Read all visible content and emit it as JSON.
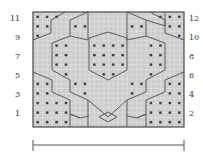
{
  "chart": {
    "columns": 16,
    "rows": 12,
    "colors": {
      "background": "#cdcdcd",
      "grid": "#e6e6e6",
      "border": "#4a4a4a",
      "cable_line": "#5a5a5a",
      "dot": "#3e3e3e",
      "label": "#333333",
      "scale_bar": "#555555"
    },
    "left_row_labels": [
      "11",
      "9",
      "7",
      "5",
      "3",
      "1"
    ],
    "right_row_labels": [
      "12",
      "10",
      "8",
      "6",
      "4",
      "2"
    ],
    "dots": [
      [
        0,
        [
          0,
          1,
          2,
          13,
          14,
          15
        ]
      ],
      [
        1,
        [
          0,
          1,
          4,
          5,
          10,
          11,
          14,
          15
        ]
      ],
      [
        2,
        [
          0,
          15
        ]
      ],
      [
        3,
        [
          2,
          3,
          6,
          7,
          8,
          9,
          12,
          13
        ]
      ],
      [
        4,
        [
          2,
          3,
          6,
          7,
          8,
          9,
          12,
          13
        ]
      ],
      [
        5,
        [
          2,
          3,
          6,
          7,
          8,
          9,
          12,
          13
        ]
      ],
      [
        6,
        [
          3,
          7,
          8,
          12
        ]
      ],
      [
        7,
        [
          0,
          1,
          4,
          5,
          10,
          11,
          14,
          15
        ]
      ],
      [
        8,
        [
          0,
          1,
          5,
          10,
          14,
          15
        ]
      ],
      [
        9,
        [
          0,
          1,
          2,
          3,
          12,
          13,
          14,
          15
        ]
      ],
      [
        10,
        [
          0,
          1,
          2,
          3,
          12,
          13,
          14,
          15
        ]
      ],
      [
        11,
        [
          0,
          1,
          2,
          3,
          12,
          13,
          14,
          15
        ]
      ]
    ]
  },
  "scale_bar": {
    "label": ""
  }
}
